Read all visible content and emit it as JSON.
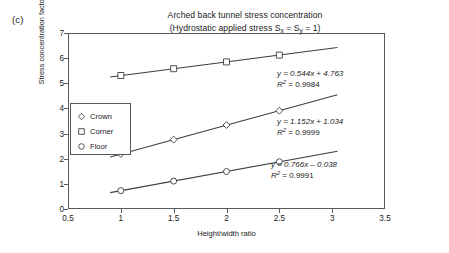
{
  "panel": {
    "label": "(c)"
  },
  "title": {
    "line1": "Arched back tunnel stress concentration",
    "line2_pre": "(Hydrostatic applied stress S",
    "line2_subx": "x",
    "line2_mid": " = S",
    "line2_suby": "y",
    "line2_post": " = 1)"
  },
  "axes": {
    "xlabel": "Height/width ratio",
    "ylabel": "Stress concentration factor",
    "xticks": [
      "0.5",
      "1",
      "1.5",
      "2",
      "2.5",
      "3",
      "3.5"
    ],
    "yticks": [
      "0",
      "1",
      "2",
      "3",
      "4",
      "5",
      "6",
      "7"
    ]
  },
  "legend": {
    "items": [
      {
        "label": "Crown",
        "marker": "diamond-marker"
      },
      {
        "label": "Corner",
        "marker": "square-marker"
      },
      {
        "label": "Floor",
        "marker": "circle-marker"
      }
    ]
  },
  "annotations": [
    {
      "equation": "y = 0.544x + 4.763",
      "r2_label": "R",
      "r2_sup": "2",
      "r2_value": " = 0.9984"
    },
    {
      "equation": "y = 1.152x + 1.034",
      "r2_label": "R",
      "r2_sup": "2",
      "r2_value": " = 0.9999"
    },
    {
      "equation": "y = 0.766x – 0.038",
      "r2_label": "R",
      "r2_sup": "2",
      "r2_value": " = 0.9991"
    }
  ],
  "colors": {
    "axis": "#555a5e",
    "line": "#3a3f44",
    "marker_fill": "#ffffff",
    "text": "#1a1a1a"
  },
  "chart_data": {
    "type": "scatter",
    "title": "Arched back tunnel stress concentration (Hydrostatic applied stress Sx = Sy = 1)",
    "xlabel": "Height/width ratio",
    "ylabel": "Stress concentration factor",
    "xlim": [
      0.5,
      3.5
    ],
    "ylim": [
      0,
      7
    ],
    "xtick_step": 0.5,
    "ytick_step": 1,
    "grid": false,
    "legend_position": "inside-left",
    "x": [
      1,
      1.5,
      2,
      2.5
    ],
    "series": [
      {
        "name": "Corner",
        "marker": "square",
        "values": [
          5.31,
          5.58,
          5.85,
          6.12
        ],
        "fit": "y = 0.544x + 4.763",
        "slope": 0.544,
        "intercept": 4.763,
        "r_squared": 0.9984
      },
      {
        "name": "Crown",
        "marker": "diamond",
        "values": [
          2.19,
          2.76,
          3.34,
          3.91
        ],
        "fit": "y = 1.152x + 1.034",
        "slope": 1.152,
        "intercept": 1.034,
        "r_squared": 0.9999
      },
      {
        "name": "Floor",
        "marker": "circle",
        "values": [
          0.73,
          1.11,
          1.49,
          1.88
        ],
        "fit": "y = 0.766x – 0.038",
        "slope": 0.766,
        "intercept": -0.038,
        "r_squared": 0.9991
      }
    ],
    "trend_extent": [
      0.9,
      3.05
    ]
  }
}
